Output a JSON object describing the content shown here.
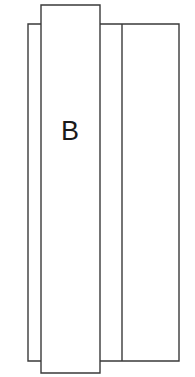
{
  "figure": {
    "background_color": "#ffffff",
    "line_color": "#3a3a3a",
    "label_color": "#1a1a1a",
    "canvas": {
      "width": 195,
      "height": 377
    },
    "labels": [
      {
        "name": "label-b",
        "text": "B",
        "x": 70,
        "y": 140,
        "font_size": 27
      }
    ],
    "shapes": [
      {
        "name": "wide-rectangle",
        "type": "rect",
        "x": 28,
        "y": 24,
        "width": 151,
        "height": 337
      },
      {
        "name": "divider-line",
        "type": "line",
        "x1": 122,
        "y1": 24,
        "x2": 122,
        "y2": 361
      },
      {
        "name": "narrow-rectangle",
        "type": "rect",
        "x": 41,
        "y": 5,
        "width": 59,
        "height": 368
      }
    ]
  }
}
